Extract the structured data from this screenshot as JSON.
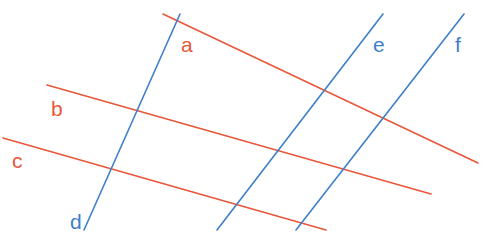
{
  "diagram": {
    "colors": {
      "red": "#e8573a",
      "blue": "#3d7fc8"
    },
    "lines": [
      {
        "id": "a",
        "label": "a",
        "color": "red",
        "x1": 163,
        "y1": 14,
        "x2": 478,
        "y2": 163,
        "lx": 181,
        "ly": 52
      },
      {
        "id": "b",
        "label": "b",
        "color": "red",
        "x1": 47,
        "y1": 85,
        "x2": 431,
        "y2": 194,
        "lx": 51,
        "ly": 116
      },
      {
        "id": "c",
        "label": "c",
        "color": "red",
        "x1": 3,
        "y1": 138,
        "x2": 326,
        "y2": 230,
        "lx": 12,
        "ly": 168
      },
      {
        "id": "d",
        "label": "d",
        "color": "blue",
        "x1": 180,
        "y1": 14,
        "x2": 84,
        "y2": 230,
        "lx": 70,
        "ly": 229
      },
      {
        "id": "e",
        "label": "e",
        "color": "blue",
        "x1": 383,
        "y1": 14,
        "x2": 217,
        "y2": 230,
        "lx": 373,
        "ly": 52
      },
      {
        "id": "f",
        "label": "f",
        "color": "blue",
        "x1": 464,
        "y1": 14,
        "x2": 296,
        "y2": 230,
        "lx": 455,
        "ly": 52
      }
    ]
  }
}
